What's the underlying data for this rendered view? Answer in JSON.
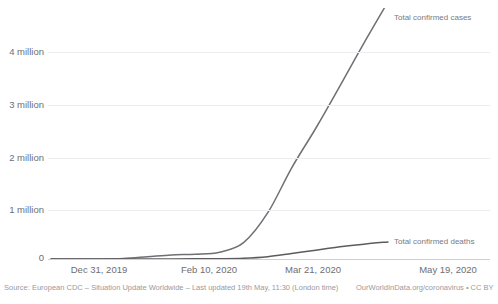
{
  "chart_data": {
    "type": "line",
    "title": "",
    "clipped_top_text": "",
    "xlabel": "",
    "ylabel": "",
    "ylim": [
      0,
      4600000
    ],
    "grid": true,
    "gridlines": [
      1000000,
      2000000,
      3000000,
      4000000
    ],
    "legend_position": "right-inline",
    "x_tick_labels": [
      "Dec 31, 2019",
      "Feb 10, 2020",
      "Mar 21, 2020",
      "May 19, 2020"
    ],
    "y_tick_labels": [
      "0",
      "1 million",
      "2 million",
      "3 million",
      "4 million"
    ],
    "y_tick_values": [
      0,
      1000000,
      2000000,
      3000000,
      4000000
    ],
    "x_start": "Dec 31, 2019",
    "x_end": "May 19, 2020",
    "series": [
      {
        "name": "Total confirmed cases",
        "color": "#6f6f74",
        "label_x": "May 19, 2020",
        "label_y": 4800000,
        "x": [
          "Dec 31, 2019",
          "Jan 10, 2020",
          "Jan 20, 2020",
          "Jan 30, 2020",
          "Feb 10, 2020",
          "Feb 20, 2020",
          "Mar 01, 2020",
          "Mar 11, 2020",
          "Mar 21, 2020",
          "Mar 31, 2020",
          "Apr 10, 2020",
          "Apr 20, 2020",
          "Apr 30, 2020",
          "May 09, 2020",
          "May 19, 2020"
        ],
        "values": [
          0,
          0,
          300,
          8200,
          40700,
          76200,
          88400,
          126400,
          304500,
          857500,
          1698400,
          2435000,
          3220000,
          4020000,
          4790000
        ]
      },
      {
        "name": "Total confirmed deaths",
        "color": "#5c5c60",
        "label_x": "May 19, 2020",
        "label_y": 318000,
        "x": [
          "Dec 31, 2019",
          "Jan 10, 2020",
          "Jan 20, 2020",
          "Jan 30, 2020",
          "Feb 10, 2020",
          "Feb 20, 2020",
          "Mar 01, 2020",
          "Mar 11, 2020",
          "Mar 21, 2020",
          "Mar 31, 2020",
          "Apr 10, 2020",
          "Apr 20, 2020",
          "Apr 30, 2020",
          "May 09, 2020",
          "May 19, 2020"
        ],
        "values": [
          0,
          0,
          6,
          170,
          1016,
          2247,
          2996,
          4600,
          13000,
          42100,
          102600,
          165000,
          227000,
          277000,
          318000
        ]
      }
    ]
  },
  "axes": {
    "y_labels": [
      {
        "text": "4 million",
        "top": 47
      },
      {
        "text": "3 million",
        "top": 100
      },
      {
        "text": "2 million",
        "top": 153
      },
      {
        "text": "1 million",
        "top": 205
      },
      {
        "text": "0",
        "top": 253
      }
    ],
    "x_labels": [
      {
        "text": "Dec 31, 2019",
        "left": 51
      },
      {
        "text": "Feb 10, 2020",
        "left": 161
      },
      {
        "text": "Mar 21, 2020",
        "left": 265
      },
      {
        "text": "May 19, 2020",
        "left": 400
      }
    ]
  },
  "legend": {
    "cases": "Total confirmed cases",
    "deaths": "Total confirmed deaths"
  },
  "footer": {
    "source": "Source: European CDC – Situation Update Worldwide – Last updated 19th May, 11:30 (London time)",
    "credit": "OurWorldInData.org/coronavirus • CC BY"
  },
  "colors": {
    "grid": "#ededef",
    "axis": "#cfcfd2",
    "cases_line": "#6f6f74",
    "deaths_line": "#5c5c60",
    "text": "#6e6e72",
    "footer_text": "#9a9a9e"
  }
}
